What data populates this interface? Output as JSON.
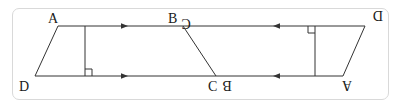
{
  "diagram": {
    "colors": {
      "stroke": "#333333",
      "frame": "#d9d9d9",
      "label": "#1a1a1a"
    },
    "labels": {
      "left_A": "A",
      "left_D": "D",
      "left_B": "B",
      "left_C": "C",
      "right_B": "B",
      "right_C": "C",
      "right_A": "A",
      "right_D": "D"
    },
    "markers": {
      "parallel_arrows_left": "→",
      "parallel_arrows_right": "←",
      "right_angle": "⊾"
    }
  }
}
